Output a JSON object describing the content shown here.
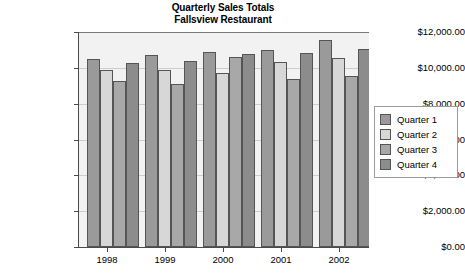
{
  "chart_data": {
    "type": "bar",
    "title": "Quarterly Sales Totals",
    "subtitle": "Fallsview Restaurant",
    "xlabel": "",
    "ylabel": "",
    "categories": [
      "1998",
      "1999",
      "2000",
      "2001",
      "2002"
    ],
    "series": [
      {
        "name": "Quarter 1",
        "color": "#9a9a9a",
        "values": [
          10500,
          10700,
          10900,
          11000,
          11550
        ]
      },
      {
        "name": "Quarter 2",
        "color": "#d7d7d7",
        "values": [
          9900,
          9900,
          9700,
          10300,
          10550
        ]
      },
      {
        "name": "Quarter 3",
        "color": "#a8a8a8",
        "values": [
          9250,
          9100,
          10600,
          9350,
          9550
        ]
      },
      {
        "name": "Quarter 4",
        "color": "#8c8c8c",
        "values": [
          10250,
          10400,
          10750,
          10850,
          11050
        ]
      }
    ],
    "ylim": [
      0,
      12000
    ],
    "ytick_values": [
      0,
      2000,
      4000,
      6000,
      8000,
      10000,
      12000
    ],
    "ytick_labels": [
      "$0.00",
      "$2,000.00",
      "$4,000.00",
      "$6,000.00",
      "$8,000.00",
      "$10,000.00",
      "$12,000.00"
    ],
    "grid": true,
    "legend_position": "right",
    "legend_entries": [
      "Quarter 1",
      "Quarter 2",
      "Quarter 3",
      "Quarter 4"
    ],
    "plot_background": "#f2f2f2",
    "gridline_color": "#cdcdcd",
    "axis_color": "#4a4a4a"
  }
}
